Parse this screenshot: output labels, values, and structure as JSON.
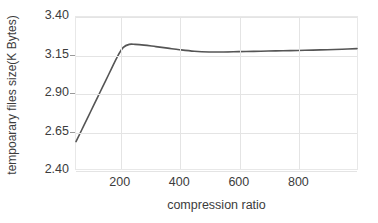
{
  "chart_data": {
    "type": "line",
    "title": "",
    "xlabel": "compression ratio",
    "ylabel": "tempoarary files size(K Bytes)",
    "xlim": [
      50,
      1000
    ],
    "ylim": [
      2.4,
      3.4
    ],
    "grid": true,
    "legend": null,
    "legend_position": "none",
    "xticks": [
      200,
      400,
      600,
      800
    ],
    "xtick_labels": [
      "200",
      "400",
      "600",
      "800"
    ],
    "yticks": [
      2.4,
      2.65,
      2.9,
      3.15,
      3.4
    ],
    "ytick_labels": [
      "2.40",
      "2.65",
      "2.90",
      "3.15",
      "3.40"
    ],
    "line_color": "#555555",
    "grid_color": "#e4e4e4",
    "series": [
      {
        "name": "temporary files size",
        "x": [
          50,
          70,
          90,
          110,
          130,
          150,
          170,
          190,
          210,
          230,
          250,
          280,
          320,
          360,
          400,
          450,
          500,
          550,
          600,
          650,
          700,
          750,
          800,
          850,
          900,
          950,
          1000
        ],
        "values": [
          2.58,
          2.66,
          2.74,
          2.82,
          2.9,
          2.98,
          3.06,
          3.14,
          3.2,
          3.22,
          3.22,
          3.215,
          3.205,
          3.195,
          3.185,
          3.175,
          3.17,
          3.17,
          3.172,
          3.174,
          3.176,
          3.178,
          3.18,
          3.182,
          3.185,
          3.188,
          3.192
        ]
      }
    ]
  }
}
